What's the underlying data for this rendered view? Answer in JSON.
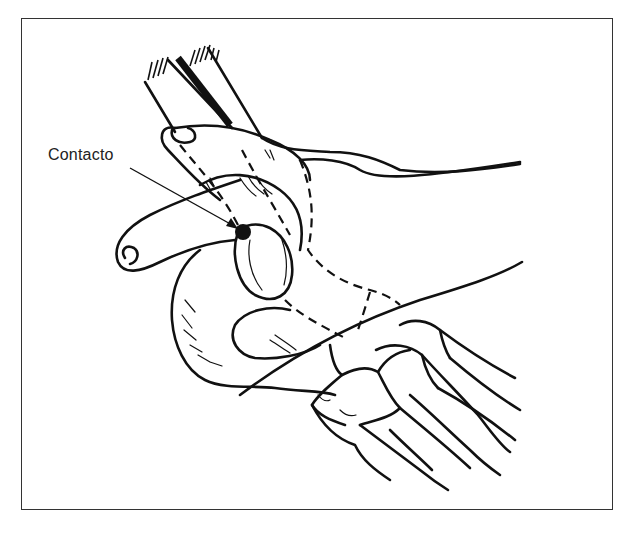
{
  "figure": {
    "label": "Contacto",
    "colors": {
      "line": "#111111",
      "background": "#ffffff",
      "frame": "#333333"
    },
    "contact_point": {
      "x": 243,
      "y": 232
    }
  }
}
